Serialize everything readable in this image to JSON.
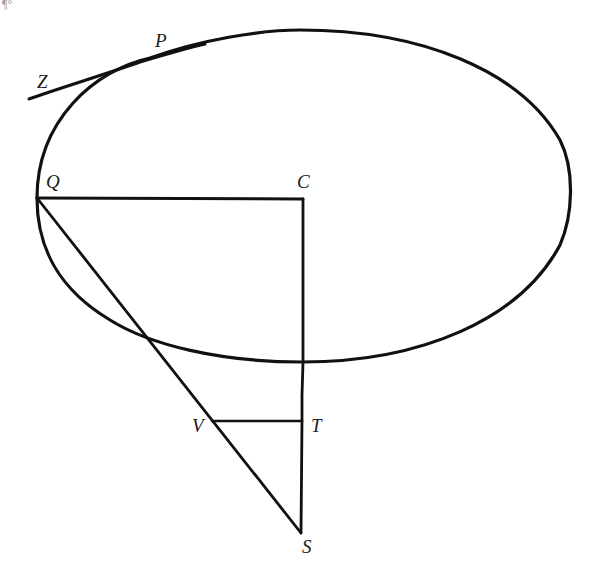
{
  "figure": {
    "title": "",
    "background": "#ffffff",
    "ink": "#111111",
    "corner_fragment": "¶°"
  },
  "labels": {
    "P": "P",
    "Z": "Z",
    "Q": "Q",
    "C": "C",
    "V": "V",
    "T": "T",
    "S": "S"
  },
  "geometry": {
    "ellipse": {
      "cx": 304,
      "cy": 196,
      "rx": 267,
      "ry": 166
    },
    "points": {
      "P": [
        140,
        62
      ],
      "Z": [
        29,
        99
      ],
      "Q": [
        37,
        198
      ],
      "C": [
        303,
        199
      ],
      "V": [
        212,
        421
      ],
      "T": [
        302,
        421
      ],
      "S": [
        301,
        533
      ]
    },
    "segments": [
      [
        "Q",
        "C"
      ],
      [
        "C",
        "S"
      ],
      [
        "Q",
        "S"
      ],
      [
        "V",
        "T"
      ]
    ]
  }
}
